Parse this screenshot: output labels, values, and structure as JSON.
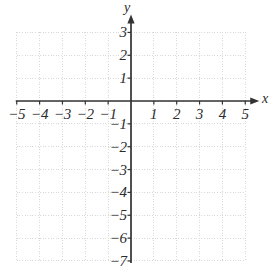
{
  "figure": {
    "title": "",
    "width": 273,
    "height": 278,
    "background_color": "#ffffff"
  },
  "axis_names": {
    "x": "x",
    "y": "y"
  },
  "colors": {
    "axis": "#333333",
    "grid": "#d9d9d9",
    "text": "#2b2b2b",
    "background": "#ffffff"
  },
  "chart_data": {
    "type": "scatter",
    "title": "",
    "xlabel": "x",
    "ylabel": "y",
    "xlim": [
      -5,
      5
    ],
    "ylim": [
      -7,
      3
    ],
    "grid": true,
    "grid_style": "dotted",
    "legend": "none",
    "series": [],
    "x": [],
    "y": [],
    "xticks": [
      -5,
      -4,
      -3,
      -2,
      -1,
      1,
      2,
      3,
      4,
      5
    ],
    "yticks": [
      3,
      2,
      1,
      -1,
      -2,
      -3,
      -4,
      -5,
      -6,
      -7
    ],
    "xtick_labels": [
      "−5",
      "−4",
      "−3",
      "−2",
      "−1",
      "1",
      "2",
      "3",
      "4",
      "5"
    ],
    "ytick_labels": [
      "3",
      "2",
      "1",
      "−1",
      "−2",
      "−3",
      "−4",
      "−5",
      "−6",
      "−7"
    ],
    "origin_px": [
      131,
      101
    ],
    "unit_px": 22.85,
    "annotations": []
  }
}
